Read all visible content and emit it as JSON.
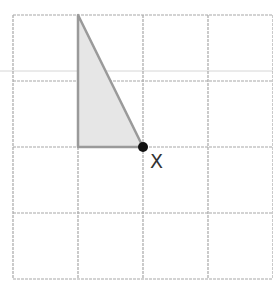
{
  "diagram": {
    "grid": {
      "columns": 4,
      "rows": 4,
      "origin_x": 13,
      "origin_y": 15,
      "cell_width": 65,
      "cell_height": 66,
      "line_color": "#a8a8a8",
      "dash": "3 1"
    },
    "artifact_line": {
      "y": 71,
      "color": "#d6d6d6"
    },
    "triangle": {
      "vertices_grid": [
        [
          1,
          0
        ],
        [
          1,
          2
        ],
        [
          2,
          2
        ]
      ],
      "fill": "#e6e6e6",
      "stroke": "#9a9a9a"
    },
    "point": {
      "grid": [
        2,
        2
      ],
      "label": "X",
      "color": "#111111",
      "radius": 5
    }
  }
}
